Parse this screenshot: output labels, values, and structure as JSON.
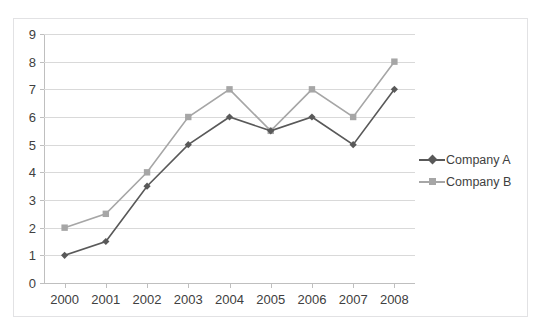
{
  "top_clipped_text": "glyph descenders of a clipped caption line",
  "chart_data": {
    "type": "line",
    "title": "",
    "subtitle": "",
    "xlabel": "",
    "ylabel": "",
    "categories": [
      "2000",
      "2001",
      "2002",
      "2003",
      "2004",
      "2005",
      "2006",
      "2007",
      "2008"
    ],
    "series": [
      {
        "name": "Company A",
        "color": "#595959",
        "marker": "diamond",
        "values": [
          1,
          1.5,
          3.5,
          5,
          6,
          5.5,
          6,
          5,
          7
        ]
      },
      {
        "name": "Company B",
        "color": "#a6a6a6",
        "marker": "square",
        "values": [
          2,
          2.5,
          4,
          6,
          7,
          5.5,
          7,
          6,
          8
        ]
      }
    ],
    "ylim": [
      0,
      9
    ],
    "ytick_labels": [
      "0",
      "1",
      "2",
      "3",
      "4",
      "5",
      "6",
      "7",
      "8",
      "9"
    ],
    "ytick_values": [
      0,
      1,
      2,
      3,
      4,
      5,
      6,
      7,
      8,
      9
    ],
    "grid": true,
    "grid_axis": "y",
    "legend": true,
    "legend_position": "right",
    "legend_entries": [
      "Company A",
      "Company B"
    ],
    "plot_background": "#ffffff",
    "gridline_color": "#d9d9d9",
    "axis_color": "#bfbfbf",
    "border_color": "#e2e2e4"
  }
}
